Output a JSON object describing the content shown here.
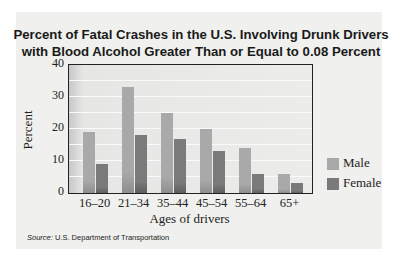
{
  "chart_data": {
    "type": "bar",
    "title": "Percent of Fatal Crashes in the U.S. Involving Drunk Drivers with Blood Alcohol Greater Than or Equal to 0.08 Percent",
    "title_lines": [
      "Percent of Fatal Crashes in the U.S. Involving Drunk Drivers",
      "with Blood Alcohol Greater Than or Equal to 0.08 Percent"
    ],
    "xlabel": "Ages of drivers",
    "ylabel": "Percent",
    "ylim": [
      0,
      40
    ],
    "yticks": [
      "0",
      "10",
      "20",
      "30",
      "40"
    ],
    "grid": true,
    "grid_interval": 5,
    "categories": [
      "16–20",
      "21–34",
      "35–44",
      "45–54",
      "55–64",
      "65+"
    ],
    "series": [
      {
        "name": "Male",
        "color": "#a9a9a9",
        "values": [
          19,
          33,
          25,
          20,
          14,
          6
        ]
      },
      {
        "name": "Female",
        "color": "#7a7a7a",
        "values": [
          9,
          18,
          17,
          13,
          6,
          3
        ]
      }
    ],
    "legend_position": "right",
    "source_label": "Source:",
    "source_text": "U.S. Department of Transportation"
  }
}
